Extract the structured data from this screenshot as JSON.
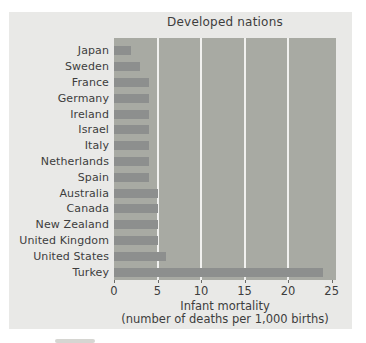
{
  "figure": {
    "background": "#ffffff",
    "panel_color": "#e9e9e7"
  },
  "chart_data": {
    "type": "bar",
    "orientation": "horizontal",
    "title": "Developed nations",
    "xlabel": "Infant mortality",
    "xlabel2": "(number of deaths per 1,000 births)",
    "categories": [
      "Japan",
      "Sweden",
      "France",
      "Germany",
      "Ireland",
      "Israel",
      "Italy",
      "Netherlands",
      "Spain",
      "Australia",
      "Canada",
      "New Zealand",
      "United Kingdom",
      "United States",
      "Turkey"
    ],
    "values": [
      2,
      3,
      4,
      4,
      4,
      4,
      4,
      4,
      4,
      5,
      5,
      5,
      5,
      6,
      24
    ],
    "xlim": [
      0,
      25.5
    ],
    "xticks": [
      0,
      5,
      10,
      15,
      20,
      25
    ],
    "gridlines": [
      5,
      10,
      15,
      20
    ],
    "grid": true,
    "legend": null,
    "colors": {
      "bar": "#8d8f8e",
      "plot_bg": "#a8aaa3",
      "gridline": "#f1f1ef",
      "text": "#3d3d3d"
    }
  }
}
